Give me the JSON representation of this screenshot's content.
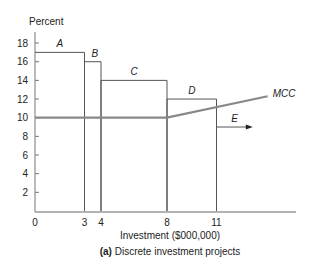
{
  "chart_data": {
    "type": "bar",
    "title": "",
    "caption_prefix": "(a)",
    "caption_text": "Discrete investment projects",
    "xlabel": "Investment ($000,000)",
    "ylabel": "Percent",
    "xlim": [
      0,
      16
    ],
    "ylim": [
      0,
      18
    ],
    "x_ticks": [
      "0",
      "3",
      "4",
      "8",
      "11"
    ],
    "y_ticks": [
      "2",
      "4",
      "6",
      "8",
      "10",
      "12",
      "14",
      "16",
      "18"
    ],
    "grid": false,
    "projects": [
      {
        "name": "A",
        "x_start": 0,
        "x_end": 3,
        "return": 17
      },
      {
        "name": "B",
        "x_start": 3,
        "x_end": 4,
        "return": 16
      },
      {
        "name": "C",
        "x_start": 4,
        "x_end": 8,
        "return": 14
      },
      {
        "name": "D",
        "x_start": 8,
        "x_end": 11,
        "return": 12
      },
      {
        "name": "E",
        "x_start": 11,
        "x_end": 13.2,
        "return": 9,
        "open_ended": true
      }
    ],
    "series": [
      {
        "name": "MCC",
        "x": [
          0,
          8,
          14.1
        ],
        "y": [
          10,
          10,
          12.3
        ]
      }
    ],
    "colors": {
      "bars": "#555555",
      "mcc": "#888888",
      "axis": "#777777"
    }
  }
}
